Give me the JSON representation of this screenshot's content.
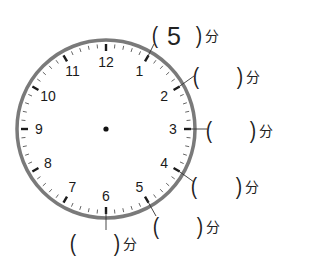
{
  "clock": {
    "center": [
      106,
      129
    ],
    "radius": 89,
    "ring_color": "#7a7a7a",
    "tick_color": "#1a1a1a",
    "numbers": [
      "12",
      "1",
      "2",
      "3",
      "4",
      "5",
      "6",
      "7",
      "8",
      "9",
      "10",
      "11"
    ],
    "hands": "none",
    "center_dot": true
  },
  "answers": [
    {
      "position": "1",
      "value": "5",
      "unit": "分"
    },
    {
      "position": "2",
      "value": "",
      "unit": "分"
    },
    {
      "position": "3",
      "value": "",
      "unit": "分"
    },
    {
      "position": "4",
      "value": "",
      "unit": "分"
    },
    {
      "position": "5",
      "value": "",
      "unit": "分"
    },
    {
      "position": "6",
      "value": "",
      "unit": "分"
    }
  ],
  "paren_open": "(",
  "paren_close": ")"
}
